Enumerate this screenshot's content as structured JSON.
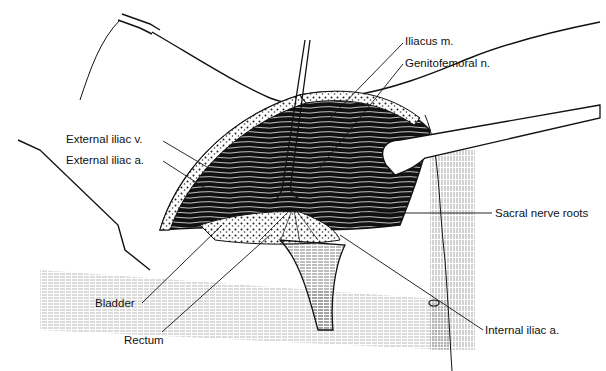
{
  "figure": {
    "type": "surgical anatomical illustration",
    "colors": {
      "ink": "#111111",
      "background": "#ffffff"
    },
    "labels": [
      {
        "id": "iliacus",
        "text": "Iliacus m.",
        "x": 405,
        "y": 35
      },
      {
        "id": "genitofemoral",
        "text": "Genitofemoral n.",
        "x": 405,
        "y": 57
      },
      {
        "id": "ext-iliac-v",
        "text": "External iliac v.",
        "x": 66,
        "y": 133
      },
      {
        "id": "ext-iliac-a",
        "text": "External iliac a.",
        "x": 66,
        "y": 154
      },
      {
        "id": "sacral",
        "text": "Sacral nerve roots",
        "x": 495,
        "y": 207
      },
      {
        "id": "bladder",
        "text": "Bladder",
        "x": 95,
        "y": 304
      },
      {
        "id": "rectum",
        "text": "Rectum",
        "x": 124,
        "y": 334
      },
      {
        "id": "int-iliac-a",
        "text": "Internal iliac a.",
        "x": 485,
        "y": 330
      }
    ]
  }
}
